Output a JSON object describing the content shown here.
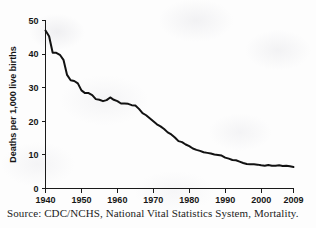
{
  "chart_data": {
    "type": "line",
    "title": "",
    "subtitle": "",
    "xlabel": "",
    "ylabel": "Deaths per 1,000 live births",
    "xlim": [
      1940,
      2009
    ],
    "ylim": [
      0,
      50
    ],
    "grid": false,
    "legend": false,
    "legend_position": "none",
    "line_color": "#121212",
    "xticks": [
      1940,
      1950,
      1960,
      1970,
      1980,
      1990,
      2000,
      2009
    ],
    "xtick_labels": [
      "1940",
      "1950",
      "1960",
      "1970",
      "1980",
      "1990",
      "2000",
      "2009"
    ],
    "yticks": [
      0,
      10,
      20,
      30,
      40,
      50
    ],
    "ytick_labels": [
      "0",
      "10",
      "20",
      "30",
      "40",
      "50"
    ],
    "series": [
      {
        "name": "Infant mortality rate",
        "x": [
          1940,
          1941,
          1942,
          1943,
          1944,
          1945,
          1946,
          1947,
          1948,
          1949,
          1950,
          1951,
          1952,
          1953,
          1954,
          1955,
          1956,
          1957,
          1958,
          1959,
          1960,
          1961,
          1962,
          1963,
          1964,
          1965,
          1966,
          1967,
          1968,
          1969,
          1970,
          1971,
          1972,
          1973,
          1974,
          1975,
          1976,
          1977,
          1978,
          1979,
          1980,
          1981,
          1982,
          1983,
          1984,
          1985,
          1986,
          1987,
          1988,
          1989,
          1990,
          1991,
          1992,
          1993,
          1994,
          1995,
          1996,
          1997,
          1998,
          1999,
          2000,
          2001,
          2002,
          2003,
          2004,
          2005,
          2006,
          2007,
          2008,
          2009
        ],
        "values": [
          47.0,
          45.3,
          40.4,
          40.4,
          39.8,
          38.3,
          33.8,
          32.2,
          32.0,
          31.3,
          29.2,
          28.4,
          28.4,
          27.8,
          26.6,
          26.4,
          26.0,
          26.3,
          27.1,
          26.4,
          26.0,
          25.3,
          25.3,
          25.2,
          24.8,
          24.7,
          23.7,
          22.4,
          21.8,
          20.9,
          20.0,
          19.1,
          18.5,
          17.7,
          16.7,
          16.1,
          15.2,
          14.1,
          13.8,
          13.1,
          12.6,
          11.9,
          11.5,
          11.2,
          10.8,
          10.6,
          10.4,
          10.1,
          10.0,
          9.8,
          9.2,
          8.9,
          8.5,
          8.4,
          8.0,
          7.6,
          7.3,
          7.2,
          7.2,
          7.1,
          6.9,
          6.8,
          7.0,
          6.8,
          6.8,
          6.9,
          6.7,
          6.8,
          6.6,
          6.4
        ]
      }
    ]
  },
  "annotations": {
    "source_note": "Source: CDC/NCHS, National Vital Statistics System, Mortality."
  }
}
